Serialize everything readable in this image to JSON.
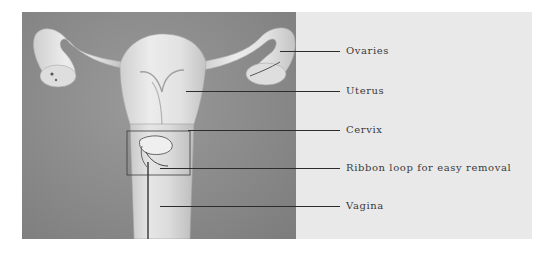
{
  "diagram": {
    "type": "anatomical-illustration",
    "colors": {
      "background": "#ffffff",
      "label_panel": "#e9e9e9",
      "photo_background": "#8a8a8a",
      "organ_fill": "#e4e4e4",
      "leader_line": "#2c2c2c",
      "label_text": "#3a3a3a"
    },
    "labels": [
      {
        "id": "ovaries",
        "text": "Ovaries"
      },
      {
        "id": "uterus",
        "text": "Uterus"
      },
      {
        "id": "cervix",
        "text": "Cervix"
      },
      {
        "id": "ribbon",
        "text": "Ribbon loop for easy removal"
      },
      {
        "id": "vagina",
        "text": "Vagina"
      }
    ]
  }
}
